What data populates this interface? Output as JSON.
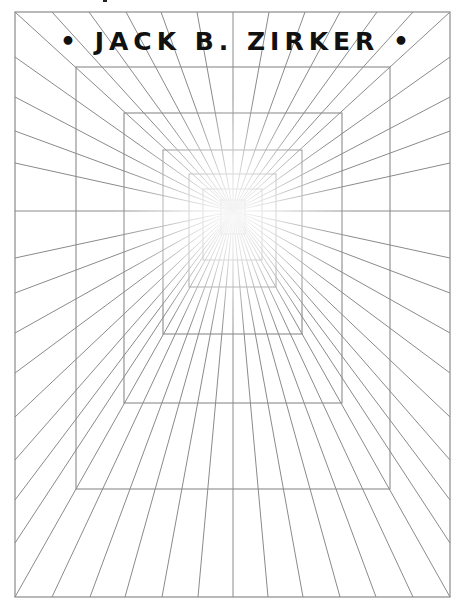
{
  "cover": {
    "author_line": "• JACK B. ZIRKER •",
    "author": "JACK B. ZIRKER"
  },
  "artwork": {
    "description": "one-point perspective tunnel of nested rectangles with radiating lines",
    "vanishing_point": [
      233,
      211
    ],
    "outer_frame": [
      15,
      12,
      450,
      597
    ],
    "rectangles": [
      [
        76,
        67,
        390,
        489
      ],
      [
        124,
        113,
        342,
        403
      ],
      [
        163,
        150,
        302,
        334
      ],
      [
        189,
        174,
        276,
        287
      ],
      [
        203,
        189,
        262,
        260
      ],
      [
        221,
        200,
        245,
        234
      ]
    ],
    "top_x": [
      15,
      52,
      89,
      126,
      161,
      197,
      233,
      269,
      305,
      340,
      377,
      413,
      450
    ],
    "bottom_x": [
      15,
      52,
      90,
      125,
      162,
      198,
      233,
      268,
      303,
      340,
      376,
      413,
      450
    ],
    "side_y": [
      57,
      97,
      131,
      163,
      211,
      258,
      293,
      333,
      373,
      417,
      460,
      500,
      543
    ],
    "line_color": "#8a8a8a",
    "text_color": "#111111"
  }
}
